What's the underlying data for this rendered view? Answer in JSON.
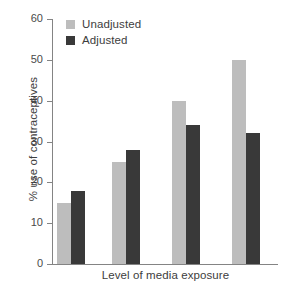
{
  "chart_data": {
    "type": "bar",
    "title": "",
    "subtitle": "",
    "xlabel": "Level of media exposure",
    "ylabel": "% use of contraceptives",
    "categories": [
      "",
      "",
      "",
      ""
    ],
    "series": [
      {
        "name": "Unadjusted",
        "color": "#bdbdbd",
        "values": [
          15,
          25,
          40,
          50
        ]
      },
      {
        "name": "Adjusted",
        "color": "#393939",
        "values": [
          18,
          28,
          34,
          32
        ]
      }
    ],
    "ylim": [
      0,
      60
    ],
    "yticks": [
      0,
      10,
      20,
      30,
      40,
      50,
      60
    ],
    "ytick_labels": [
      "0",
      "10",
      "20",
      "30",
      "40",
      "50",
      "60"
    ],
    "xticks": [],
    "xtick_labels": [],
    "grid": false,
    "legend_position": "top-left",
    "axis_color": "#848484",
    "text_color": "#3d3d3d",
    "background": "#ffffff"
  },
  "legend": {
    "items": [
      {
        "label": "Unadjusted",
        "swatch": "legend-swatch-unadjusted"
      },
      {
        "label": "Adjusted",
        "swatch": "legend-swatch-adjusted"
      }
    ]
  }
}
